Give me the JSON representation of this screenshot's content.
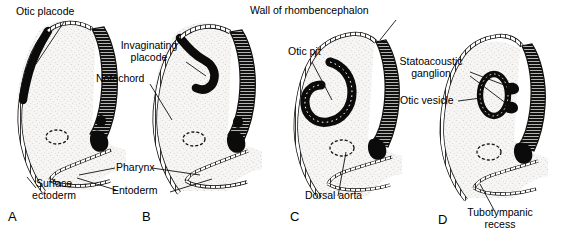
{
  "figure": {
    "background_color": "#ffffff",
    "tissue_fill": "#f5f4f1",
    "ink_color": "#000000"
  },
  "panels": [
    {
      "letter": "A",
      "stage": "Otic placode stage",
      "labels": [
        {
          "name": "otic-placode",
          "text": "Otic placode"
        },
        {
          "name": "surface-ectoderm",
          "text": "Surface\nectoderm",
          "line1": "Surface",
          "line2": "ectoderm"
        }
      ]
    },
    {
      "letter": "B",
      "stage": "Invaginating placode stage",
      "labels": [
        {
          "name": "invaginating-placode",
          "text": "Invaginating placode",
          "line1": "Invaginating",
          "line2": "placode"
        },
        {
          "name": "notochord",
          "text": "Notochord"
        },
        {
          "name": "pharynx",
          "text": "Pharynx"
        },
        {
          "name": "entoderm",
          "text": "Entoderm"
        }
      ]
    },
    {
      "letter": "C",
      "stage": "Otic pit stage",
      "labels": [
        {
          "name": "wall-of-rhombencephalon",
          "text": "Wall of rhombencephalon"
        },
        {
          "name": "otic-pit",
          "text": "Otic pit"
        },
        {
          "name": "dorsal-aorta",
          "text": "Dorsal aorta"
        }
      ]
    },
    {
      "letter": "D",
      "stage": "Otic vesicle stage",
      "labels": [
        {
          "name": "statoacoustic-ganglion",
          "text": "Statoacoustic ganglion",
          "line1": "Statoacoustic",
          "line2": "ganglion"
        },
        {
          "name": "otic-vesicle",
          "text": "Otic vesicle"
        },
        {
          "name": "tubotympanic-recess",
          "text": "Tubotympanic recess",
          "line1": "Tubotympanic",
          "line2": "recess"
        }
      ]
    }
  ],
  "labels": {
    "otic_placode": "Otic placode",
    "surface_ectoderm_l1": "Surface",
    "surface_ectoderm_l2": "ectoderm",
    "invaginating_placode_l1": "Invaginating",
    "invaginating_placode_l2": "placode",
    "notochord": "Notochord",
    "pharynx": "Pharynx",
    "entoderm": "Entoderm",
    "wall_of_rhombencephalon": "Wall of rhombencephalon",
    "otic_pit": "Otic pit",
    "dorsal_aorta": "Dorsal aorta",
    "statoacoustic_ganglion_l1": "Statoacoustic",
    "statoacoustic_ganglion_l2": "ganglion",
    "otic_vesicle": "Otic vesicle",
    "tubotympanic_recess_l1": "Tubotympanic",
    "tubotympanic_recess_l2": "recess",
    "letter_a": "A",
    "letter_b": "B",
    "letter_c": "C",
    "letter_d": "D"
  }
}
